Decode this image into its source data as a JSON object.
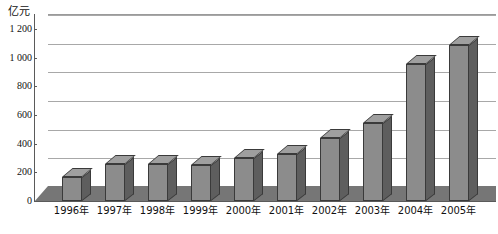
{
  "chart_data": {
    "type": "bar",
    "title": "",
    "subtitle": "",
    "xlabel": "",
    "ylabel": "亿元",
    "unit_label": "亿元",
    "categories": [
      "1996年",
      "1997年",
      "1998年",
      "1999年",
      "2000年",
      "2001年",
      "2002年",
      "2003年",
      "2004年",
      "2005年"
    ],
    "values": [
      165,
      255,
      255,
      250,
      300,
      325,
      440,
      545,
      957,
      1086
    ],
    "series": [
      {
        "name": "",
        "values": [
          165,
          255,
          255,
          250,
          300,
          325,
          440,
          545,
          957,
          1086
        ]
      }
    ],
    "ylim": [
      0,
      1200
    ],
    "ytick_values": [
      0,
      200,
      400,
      600,
      800,
      1000,
      1200
    ],
    "ytick_labels": [
      "0",
      "200",
      "400",
      "600",
      "800",
      "1 000",
      "1 200"
    ],
    "grid": true,
    "legend": "none",
    "style": "3d-column",
    "colors": {
      "bar_front": "#8c8c8c",
      "bar_side": "#5e5e5e",
      "bar_top": "#9f9f9f",
      "bar_edge": "#3a3a3a",
      "gridline": "#a8a8a8",
      "axis": "#5a5a5a",
      "floor": "#767676",
      "background": "#ffffff"
    }
  }
}
